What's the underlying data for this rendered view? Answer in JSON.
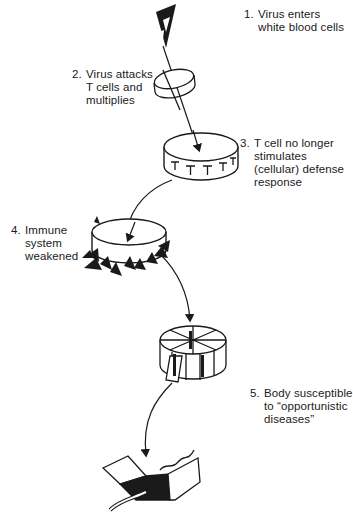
{
  "diagram": {
    "type": "process-flow",
    "steps": [
      {
        "number": "1.",
        "lines": [
          "Virus enters",
          "white blood cells"
        ],
        "icon": "virus-icon"
      },
      {
        "number": "2.",
        "lines": [
          "Virus attacks",
          "T cells and",
          "multiplies"
        ],
        "icon": "ring-cell-icon"
      },
      {
        "number": "3.",
        "lines": [
          "T cell no longer",
          "stimulates",
          "(cellular) defense",
          "response"
        ],
        "icon": "t-cell-disk-icon"
      },
      {
        "number": "4.",
        "lines": [
          "Immune",
          "system",
          "weakened"
        ],
        "icon": "spiked-disk-icon"
      },
      {
        "number": "5.",
        "lines": [
          "Body susceptible",
          "to “opportunistic",
          "diseases”"
        ],
        "icon": "broken-disk-icon"
      }
    ],
    "final_icon": "torn-body-icon",
    "colors": {
      "ink": "#1a1a1a",
      "background": "#ffffff"
    }
  }
}
